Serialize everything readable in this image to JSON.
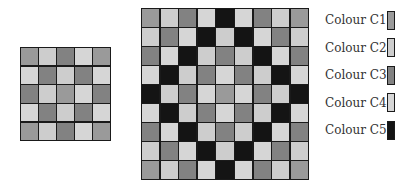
{
  "palette": {
    "C1": "#9a9a9a",
    "C2": "#cdcdcd",
    "C3": "#828282",
    "C4": "#d6d6d6",
    "C5": "#141414"
  },
  "legend": {
    "items": [
      {
        "key": "C1",
        "label": "Colour C1",
        "color": "#9a9a9a"
      },
      {
        "key": "C2",
        "label": "Colour C2",
        "color": "#cdcdcd"
      },
      {
        "key": "C3",
        "label": "Colour C3",
        "color": "#828282"
      },
      {
        "key": "C4",
        "label": "Colour C4",
        "color": "#d6d6d6"
      },
      {
        "key": "C5",
        "label": "Colour C5",
        "color": "#141414"
      }
    ]
  },
  "small_grid": {
    "rows": 5,
    "cols": 5,
    "cells": [
      [
        "C1",
        "C2",
        "C3",
        "C4",
        "C1"
      ],
      [
        "C4",
        "C3",
        "C2",
        "C3",
        "C4"
      ],
      [
        "C3",
        "C2",
        "C1",
        "C4",
        "C3"
      ],
      [
        "C4",
        "C3",
        "C2",
        "C3",
        "C4"
      ],
      [
        "C1",
        "C2",
        "C3",
        "C4",
        "C1"
      ]
    ]
  },
  "large_grid": {
    "rows": 9,
    "cols": 9,
    "cells": [
      [
        "C1",
        "C2",
        "C3",
        "C4",
        "C5",
        "C4",
        "C3",
        "C2",
        "C1"
      ],
      [
        "C2",
        "C3",
        "C4",
        "C5",
        "C2",
        "C5",
        "C4",
        "C3",
        "C2"
      ],
      [
        "C3",
        "C4",
        "C5",
        "C2",
        "C3",
        "C2",
        "C5",
        "C4",
        "C3"
      ],
      [
        "C4",
        "C5",
        "C2",
        "C3",
        "C4",
        "C3",
        "C2",
        "C5",
        "C4"
      ],
      [
        "C5",
        "C2",
        "C3",
        "C4",
        "C1",
        "C4",
        "C3",
        "C2",
        "C5"
      ],
      [
        "C4",
        "C5",
        "C2",
        "C3",
        "C4",
        "C3",
        "C2",
        "C5",
        "C4"
      ],
      [
        "C3",
        "C4",
        "C5",
        "C2",
        "C3",
        "C2",
        "C5",
        "C4",
        "C3"
      ],
      [
        "C2",
        "C3",
        "C4",
        "C5",
        "C2",
        "C5",
        "C4",
        "C3",
        "C2"
      ],
      [
        "C1",
        "C2",
        "C3",
        "C4",
        "C5",
        "C4",
        "C3",
        "C2",
        "C1"
      ]
    ]
  }
}
